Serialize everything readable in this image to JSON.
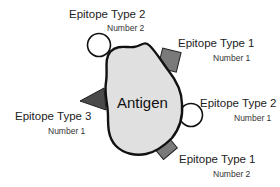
{
  "antigen": {
    "label": "Antigen",
    "fill": "#e0e0e0",
    "stroke": "#111111"
  },
  "colors": {
    "square_epitope": "#7a7a7a",
    "triangle_epitope": "#4a4a4a",
    "circle_epitope": "#ffffff"
  },
  "epitopes": [
    {
      "type": "Epitope Type 2",
      "number": "Number 2",
      "shape": "circle"
    },
    {
      "type": "Epitope Type 1",
      "number": "Number 1",
      "shape": "square"
    },
    {
      "type": "Epitope Type 3",
      "number": "Number 1",
      "shape": "triangle"
    },
    {
      "type": "Epitope Type 2",
      "number": "Number 1",
      "shape": "circle"
    },
    {
      "type": "Epitope Type 1",
      "number": "Number 2",
      "shape": "square"
    }
  ]
}
